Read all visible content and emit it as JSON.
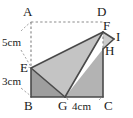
{
  "figure": {
    "kind": "geometry-fold-diagram",
    "colors": {
      "stroke": "#4a4a4a",
      "dashed": "#8c8c8c",
      "fill_light": "#c4c4c4",
      "fill_mid": "#b3b3b3",
      "fill_dark": "#9e9e9e",
      "fill_flap": "#cccccc",
      "text": "#1a1a1a",
      "background": "#ffffff"
    },
    "vertices": [
      {
        "name": "A",
        "label": "A",
        "x": 31,
        "y": 22,
        "label_x": 23,
        "label_y": 5
      },
      {
        "name": "D",
        "label": "D",
        "x": 103,
        "y": 22,
        "label_x": 97,
        "label_y": 5
      },
      {
        "name": "F",
        "label": "F",
        "x": 103,
        "y": 32,
        "label_x": 103,
        "label_y": 19
      },
      {
        "name": "I",
        "label": "I",
        "x": 114,
        "y": 39,
        "label_x": 116,
        "label_y": 30
      },
      {
        "name": "H",
        "label": "H",
        "x": 103,
        "y": 49,
        "label_x": 105,
        "label_y": 44
      },
      {
        "name": "E",
        "label": "E",
        "x": 31,
        "y": 68,
        "label_x": 20,
        "label_y": 61
      },
      {
        "name": "B",
        "label": "B",
        "x": 31,
        "y": 97,
        "label_x": 24,
        "label_y": 99
      },
      {
        "name": "G",
        "label": "G",
        "x": 65,
        "y": 97,
        "label_x": 58,
        "label_y": 99
      },
      {
        "name": "C",
        "label": "C",
        "x": 103,
        "y": 97,
        "label_x": 104,
        "label_y": 99
      }
    ],
    "measurements": [
      {
        "name": "ae-length",
        "label": "5cm",
        "label_x": 2,
        "label_y": 37
      },
      {
        "name": "eb-length",
        "label": "3cm",
        "label_x": 2,
        "label_y": 76
      },
      {
        "name": "gc-length",
        "label": "4cm",
        "label_x": 72,
        "label_y": 101
      }
    ],
    "polygons": [
      {
        "name": "triangle-ebg",
        "points": "31,68 31,97 65,97",
        "fill": "#9e9e9e"
      },
      {
        "name": "triangle-egf",
        "points": "31,68 65,97 103,32",
        "fill": "#c4c4c4"
      },
      {
        "name": "triangle-ghc",
        "points": "65,97 103,49 103,97",
        "fill": "#b3b3b3"
      },
      {
        "name": "flap-fih",
        "points": "103,32 114,39 103,49",
        "fill": "#cccccc"
      }
    ],
    "solid_edges": [
      {
        "name": "edge-eb",
        "x1": 31,
        "y1": 68,
        "x2": 31,
        "y2": 97
      },
      {
        "name": "edge-bg",
        "x1": 31,
        "y1": 97,
        "x2": 65,
        "y2": 97
      },
      {
        "name": "edge-gc",
        "x1": 65,
        "y1": 97,
        "x2": 103,
        "y2": 97
      },
      {
        "name": "edge-cf",
        "x1": 103,
        "y1": 97,
        "x2": 103,
        "y2": 49
      },
      {
        "name": "edge-ef",
        "x1": 31,
        "y1": 68,
        "x2": 103,
        "y2": 32
      },
      {
        "name": "edge-eg",
        "x1": 31,
        "y1": 68,
        "x2": 65,
        "y2": 97
      },
      {
        "name": "edge-gf",
        "x1": 65,
        "y1": 97,
        "x2": 103,
        "y2": 32
      },
      {
        "name": "edge-fi",
        "x1": 103,
        "y1": 32,
        "x2": 114,
        "y2": 39
      },
      {
        "name": "edge-ih",
        "x1": 114,
        "y1": 39,
        "x2": 103,
        "y2": 49
      }
    ],
    "dashed_edges": [
      {
        "name": "edge-ad",
        "x1": 31,
        "y1": 22,
        "x2": 103,
        "y2": 22
      },
      {
        "name": "edge-ae",
        "x1": 31,
        "y1": 22,
        "x2": 31,
        "y2": 68
      },
      {
        "name": "edge-fh",
        "x1": 103,
        "y1": 32,
        "x2": 103,
        "y2": 49
      }
    ],
    "leader_arcs": [
      {
        "name": "leader-ae",
        "path": "M 21 31 Q 27 25 31 22"
      },
      {
        "name": "leader-ae2",
        "path": "M 21 50 Q 27 60 31 67"
      },
      {
        "name": "leader-eb",
        "path": "M 21 70 Q 27 66 31 68"
      },
      {
        "name": "leader-eb2",
        "path": "M 21 88 Q 27 93 31 96"
      },
      {
        "name": "leader-gc",
        "path": "M 68 100 Q 67 98 66 97"
      },
      {
        "name": "leader-gc2",
        "path": "M 99 100 Q 101 98 102 97"
      }
    ]
  }
}
